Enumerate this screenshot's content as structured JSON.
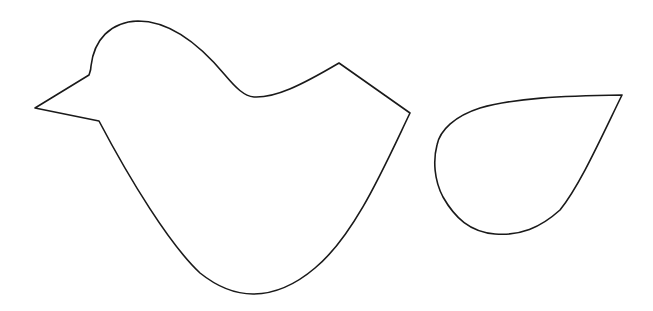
{
  "canvas": {
    "width": 653,
    "height": 311,
    "background": "#ffffff"
  },
  "shapes": [
    {
      "name": "bird-body-outline",
      "stroke": "#1a1a1a",
      "fill": "#ffffff",
      "path": "M35,108 L89,75 C90,72 91,70 91,66 C94,40 110,22 138,21 C170,21 200,45 225,75 C236,88 244,96 254,97 C275,98 300,86 339,63 L410,113 C385,165 355,235 315,268 C295,285 275,294 253,294 C232,294 215,285 200,273 C170,245 130,180 99,121 L35,108 Z"
    },
    {
      "name": "wing-outline",
      "stroke": "#1a1a1a",
      "fill": "#ffffff",
      "path": "M622,95 C560,96 515,98 480,108 C455,116 440,130 437,145 C433,160 434,180 443,197 C455,218 470,232 495,234 C520,236 540,228 560,210 C580,185 600,140 622,95 Z"
    }
  ]
}
